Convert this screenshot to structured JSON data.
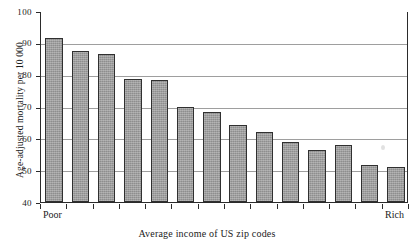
{
  "chart_data": {
    "type": "bar",
    "title": "",
    "subtitle": "",
    "xlabel": "Average income of US zip codes",
    "ylabel": "Age-adjusted mortality per 10 000",
    "ylim": [
      40,
      100
    ],
    "yticks": [
      40,
      50,
      60,
      70,
      80,
      90,
      100
    ],
    "ytick_labels": [
      "40",
      "50",
      "60",
      "70",
      "80",
      "90",
      "100"
    ],
    "grid": true,
    "legend": "none",
    "x_axis_end_labels": {
      "left": "Poor",
      "right": "Rich"
    },
    "categories": [
      "1",
      "2",
      "3",
      "4",
      "5",
      "6",
      "7",
      "8",
      "9",
      "10",
      "11",
      "12",
      "13",
      "14"
    ],
    "values": [
      91.5,
      87.5,
      86.5,
      78.8,
      78.3,
      70.0,
      68.2,
      64.3,
      62.0,
      59.0,
      56.3,
      58.0,
      51.5,
      51.0
    ],
    "bar_color": "#9c9c9c",
    "bar_edge_color": "#303030",
    "axis_color": "#2b2b2b",
    "grid_color": "#8d8d8d",
    "background_color": "#ffffff"
  },
  "figure": {
    "name": "mortality-by-income-bar-chart"
  }
}
